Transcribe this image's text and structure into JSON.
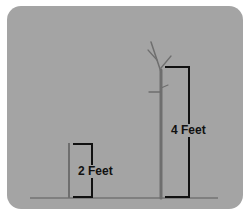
{
  "diagram": {
    "title": "",
    "colors": {
      "background": "#a4a4a4",
      "plant": "#6e6e6e",
      "bracket": "#111111",
      "ground": "#5a5a5a"
    },
    "items": [
      {
        "name": "small-seedling",
        "height_label": "2 Feet",
        "height_ft": 2
      },
      {
        "name": "tall-sapling",
        "height_label": "4 Feet",
        "height_ft": 4
      }
    ]
  }
}
